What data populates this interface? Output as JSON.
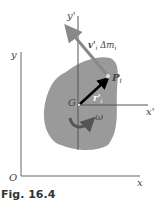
{
  "figure": {
    "caption": "Fig. 16.4",
    "labels": {
      "y_axis": "y",
      "x_axis": "x",
      "origin": "O",
      "y_prime": "y'",
      "x_prime": "x'",
      "center": "G",
      "point": "P",
      "point_sub": "i",
      "velocity_label": "v'",
      "velocity_sub": "i",
      "mass_label": " Δm",
      "mass_sub": "i",
      "position_label": "r'",
      "position_sub": "i",
      "omega": "ω"
    },
    "colors": {
      "body": "#9a9a9a",
      "velocity_arrow": "#888888",
      "position_arrow": "#000000",
      "rotation_arrow": "#555555",
      "axes": "#555555"
    }
  }
}
